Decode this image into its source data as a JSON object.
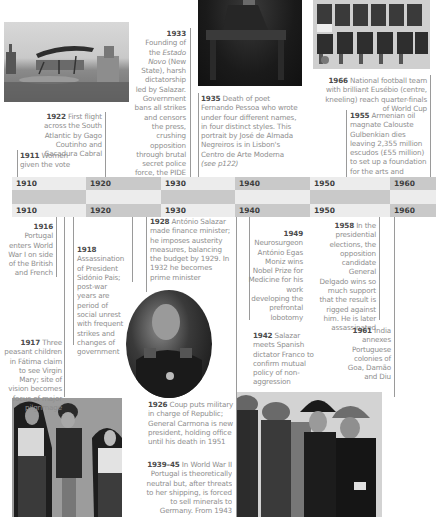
{
  "timeline": {
    "decades_top": [
      "1910",
      "1920",
      "1930",
      "1940",
      "1950",
      "1960"
    ],
    "decades_bottom": [
      "1910",
      "1920",
      "1930",
      "1940",
      "1950",
      "1960"
    ],
    "colors": {
      "band_dark": "#c9c9c9",
      "band_light": "#ececec",
      "year_text": "#3c3c3c",
      "body_text": "#8e8e8e"
    }
  },
  "entries": {
    "e1911": {
      "year": "1911",
      "text": " Women given the vote"
    },
    "e1922": {
      "year": "1922",
      "text": " First flight across the South Atlantic by Gago Coutinho and Sacadura Cabral"
    },
    "e1933": {
      "year": "1933",
      "text_a": " Founding of the ",
      "text_it": "Estado Novo",
      "text_b": " (New State), harsh dictatorship led by Salazar. Government bans all strikes and censors the press, crushing opposition through brutal secret police force, the PIDE"
    },
    "e1935": {
      "year": "1935",
      "text": " Death of poet Fernando Pessoa who wrote under four different names, in four distinct styles. This portrait by José de Almada Negreiros is in Lisbon's Centro de Arte Moderna",
      "ref": "(see p122)"
    },
    "e1966": {
      "year": "1966",
      "text": " National football team with brilliant Eusébio (centre, kneeling) reach quarter-finals of World Cup"
    },
    "e1955": {
      "year": "1955",
      "text": " Armenian oil magnate Calouste Gulbenkian dies leaving 2,355 million escudos (£55 million) to set up a foundation for the arts and education"
    },
    "e1916": {
      "year": "1916",
      "text": "Portugal enters World War I on side of the British and French"
    },
    "e1918": {
      "year": "1918",
      "text": "Assassination of President Sidónio Pais; post-war years are period of social unrest with frequent strikes and changes of government"
    },
    "e1917": {
      "year": "1917",
      "text": " Three peasant children in Fátima claim to see Virgin Mary; site of vision becomes focus of major pilgrimage"
    },
    "e1928": {
      "year": "1928",
      "text": " António Salazar made finance minister; he imposes austerity measures, balancing the budget by 1929. In 1932 he becomes prime minister"
    },
    "e1949": {
      "year": "1949",
      "text": "Neurosurgeon António Egas Moniz wins Nobel Prize for Medicine for his work developing the prefrontal lobotomy"
    },
    "e1942": {
      "year": "1942",
      "text": " Salazar meets Spanish dictator Franco to confirm mutual policy of non-aggression"
    },
    "e1958": {
      "year": "1958",
      "text": " In the presidential elections, the opposition candidate General Delgado wins so much support that the result is rigged against him. He is later assassinated"
    },
    "e1961": {
      "year": "1961",
      "text": " India annexes Portuguese colonies of Goa, Damão and Diu"
    },
    "e1926": {
      "year": "1926",
      "text": " Coup puts military in charge of Republic; General Carmona is new president, holding office until his death in 1951"
    },
    "e1939": {
      "year": "1939–45",
      "text": " In World War II Portugal is theoretically neutral but, after threats to her shipping, is forced to sell minerals to Germany. From 1943 Portugal permits"
    }
  },
  "photos": {
    "seaplane": "seaplane-photo",
    "pessoa": "pessoa-portrait",
    "football": "football-team-photo",
    "salazar": "salazar-oval-portrait",
    "fatima": "fatima-children-photo",
    "franco": "salazar-franco-photo"
  }
}
